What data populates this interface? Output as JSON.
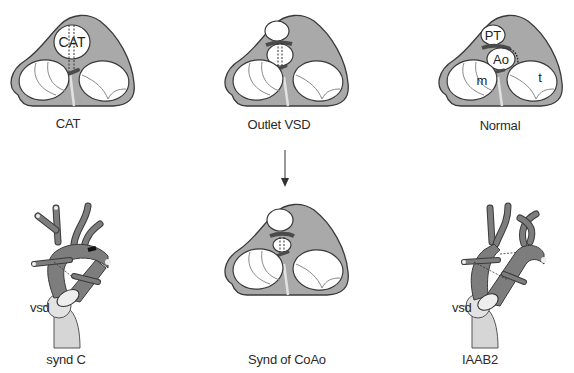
{
  "colors": {
    "heart_fill": "#a9a9a9",
    "heart_stroke": "#3a3a3a",
    "valve_fill": "#ffffff",
    "vessel_fill": "#7d7d7d",
    "ventricle_fill": "#d6d6d6",
    "septum": "#e2e2e2",
    "dark_band": "#4a4a4a",
    "text": "#2a2a2a"
  },
  "panels": {
    "top": [
      {
        "id": "cat",
        "caption": "CAT",
        "valve_label": "CAT"
      },
      {
        "id": "outlet-vsd",
        "caption": "Outlet VSD"
      },
      {
        "id": "normal",
        "caption": "Normal",
        "labels": {
          "pt": "PT",
          "ao": "Ao",
          "mitral": "m",
          "tricuspid": "t"
        }
      }
    ],
    "bottom": [
      {
        "id": "synd-c",
        "caption": "synd C",
        "vsd_label": "vsd"
      },
      {
        "id": "synd-coao",
        "caption": "Synd of CoAo"
      },
      {
        "id": "iaab2",
        "caption": "IAAB2",
        "vsd_label": "vsd"
      }
    ]
  },
  "arrow": {
    "from": "Outlet VSD",
    "to": "Synd of CoAo",
    "direction": "down"
  }
}
